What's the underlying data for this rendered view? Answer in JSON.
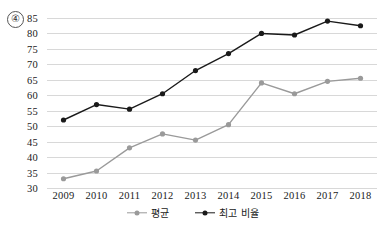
{
  "item_number": "④",
  "legend": {
    "position": "bottom-center",
    "items": [
      {
        "label": "평균",
        "color": "#9a9a9a",
        "marker": "circle-dot"
      },
      {
        "label": "최고 비율",
        "color": "#1a1a1a",
        "marker": "circle-dot"
      }
    ]
  },
  "chart_data": {
    "type": "line",
    "title": "",
    "subtitle": "",
    "xlabel": "",
    "ylabel": "",
    "categories": [
      "2009",
      "2010",
      "2011",
      "2012",
      "2013",
      "2014",
      "2015",
      "2016",
      "2017",
      "2018"
    ],
    "yticks": [
      30,
      35,
      40,
      45,
      50,
      55,
      60,
      65,
      70,
      75,
      80,
      85
    ],
    "ylim": [
      30,
      85
    ],
    "grid": true,
    "legend_position": "bottom-center",
    "series": [
      {
        "name": "평균",
        "color": "#9a9a9a",
        "values": [
          33,
          35.5,
          43,
          47.5,
          45.5,
          50.5,
          64,
          60.5,
          64.5,
          65.5
        ]
      },
      {
        "name": "최고 비율",
        "color": "#1a1a1a",
        "values": [
          52,
          57,
          55.5,
          60.5,
          68,
          73.5,
          80,
          79.5,
          84,
          82.5
        ]
      }
    ]
  }
}
